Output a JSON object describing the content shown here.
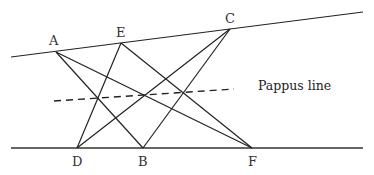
{
  "diagram": {
    "points": {
      "A": {
        "label": "A"
      },
      "E": {
        "label": "E"
      },
      "C": {
        "label": "C"
      },
      "D": {
        "label": "D"
      },
      "B": {
        "label": "B"
      },
      "F": {
        "label": "F"
      }
    },
    "upper_line_points": [
      "A",
      "E",
      "C"
    ],
    "lower_line_points": [
      "D",
      "B",
      "F"
    ],
    "cross_segments": [
      [
        "A",
        "B"
      ],
      [
        "A",
        "F"
      ],
      [
        "E",
        "D"
      ],
      [
        "E",
        "F"
      ],
      [
        "C",
        "D"
      ],
      [
        "C",
        "B"
      ]
    ],
    "pappus_line_label": "Pappus line",
    "line_color": "#222222"
  }
}
